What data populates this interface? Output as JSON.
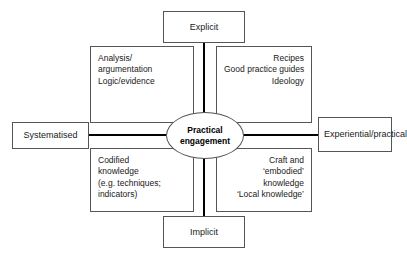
{
  "diagram": {
    "type": "two-axis-quadrant-matrix",
    "centre": {
      "label_lines": [
        "Practical",
        "engagement"
      ],
      "label_text": "Practical engagement",
      "shape": "ellipse",
      "bold": true
    },
    "axes": {
      "vertical": {
        "top_pole": "Explicit",
        "bottom_pole": "Implicit"
      },
      "horizontal": {
        "left_pole": "Systematised",
        "right_pole_lines": [
          "Experiential/",
          "practical"
        ],
        "right_pole_text": "Experiential/ practical"
      }
    },
    "quadrants": [
      {
        "id": "top-left",
        "position": "Explicit + Systematised",
        "align": "left",
        "lines": [
          "Analysis/",
          "argumentation",
          "Logic/evidence"
        ]
      },
      {
        "id": "top-right",
        "position": "Explicit + Experiential/practical",
        "align": "right",
        "lines": [
          "Recipes",
          "Good practice guides",
          "Ideology"
        ]
      },
      {
        "id": "bottom-left",
        "position": "Implicit + Systematised",
        "align": "left",
        "lines": [
          "Codified",
          "knowledge",
          "(e.g. techniques;",
          "indicators)"
        ]
      },
      {
        "id": "bottom-right",
        "position": "Implicit + Experiential/practical",
        "align": "right",
        "lines": [
          "Craft and",
          "‘embodied’",
          "knowledge",
          "‘Local knowledge’"
        ]
      }
    ],
    "colors": {
      "background": "#ffffff",
      "box_border": "#555555",
      "axis_line": "#000000",
      "text": "#1a1a1a"
    }
  }
}
